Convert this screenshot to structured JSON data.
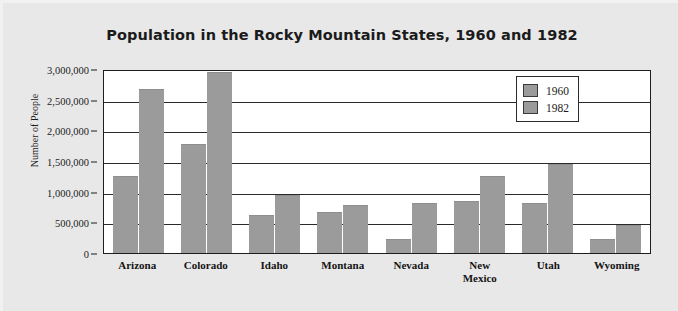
{
  "chart_data": {
    "type": "bar",
    "title": "Population in the Rocky Mountain States, 1960 and 1982",
    "xlabel": "",
    "ylabel": "Number of People",
    "ylim": [
      0,
      3000000
    ],
    "ytick_labels": [
      "3,000,000",
      "2,500,000",
      "2,000,000",
      "1,500,000",
      "1,000,000",
      "500,000",
      "0"
    ],
    "ytick_values": [
      3000000,
      2500000,
      2000000,
      1500000,
      1000000,
      500000,
      0
    ],
    "grid": true,
    "legend_position": "top-right",
    "categories": [
      "Arizona",
      "Colorado",
      "Idaho",
      "Montana",
      "Nevada",
      "New Mexico",
      "Utah",
      "Wyoming"
    ],
    "category_lines": [
      [
        "Arizona"
      ],
      [
        "Colorado"
      ],
      [
        "Idaho"
      ],
      [
        "Montana"
      ],
      [
        "Nevada"
      ],
      [
        "New",
        "Mexico"
      ],
      [
        "Utah"
      ],
      [
        "Wyoming"
      ]
    ],
    "series": [
      {
        "name": "1960",
        "color": "#9b9b9b",
        "values": [
          1250000,
          1780000,
          620000,
          670000,
          230000,
          850000,
          820000,
          230000
        ]
      },
      {
        "name": "1982",
        "color": "#9b9b9b",
        "values": [
          2680000,
          2950000,
          950000,
          780000,
          820000,
          1250000,
          1450000,
          450000
        ]
      }
    ]
  },
  "legend": {
    "items": [
      {
        "label": "1960"
      },
      {
        "label": "1982"
      }
    ]
  },
  "colors": {
    "bar": "#9b9b9b",
    "axis": "#1d1d1d",
    "plot_background": "#ffffff",
    "figure_background": "#e8e8e8",
    "text": "#1b1b1b"
  }
}
